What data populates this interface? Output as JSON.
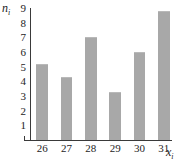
{
  "chart_data": {
    "type": "bar",
    "title": "",
    "subtitle": "",
    "xlabel": "x",
    "xlabel_sub": "i",
    "ylabel": "n",
    "ylabel_sub": "i",
    "categories": [
      "26",
      "27",
      "28",
      "29",
      "30",
      "31"
    ],
    "values": [
      5.2,
      4.3,
      7.0,
      3.3,
      6.0,
      8.8
    ],
    "ylim": [
      0,
      9
    ],
    "ytick_labels": [
      "1",
      "2",
      "3",
      "4",
      "5",
      "6",
      "7",
      "8",
      "9"
    ],
    "ytick_values": [
      1,
      2,
      3,
      4,
      5,
      6,
      7,
      8,
      9
    ],
    "grid": false,
    "legend": null,
    "legend_position": "none",
    "annotations": []
  },
  "style": {
    "bar_color": "#a8a8a8",
    "bar_edge_color": "#b9b9b9",
    "axis_color": "#3a3a3a",
    "text_color": "#1d1d1d",
    "background": "#ffffff"
  }
}
